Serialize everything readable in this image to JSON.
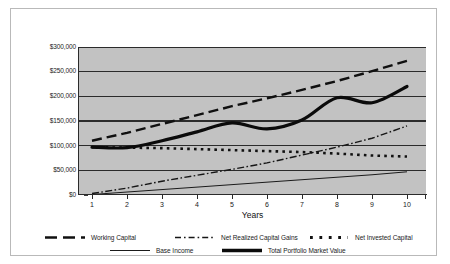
{
  "chart_data": {
    "type": "line",
    "title": "",
    "xlabel": "Years",
    "ylabel": "",
    "grid": true,
    "legend_position": "bottom",
    "x": [
      1,
      2,
      3,
      4,
      5,
      6,
      7,
      8,
      9,
      10
    ],
    "x_tick_labels": [
      "1",
      "2",
      "3",
      "4",
      "5",
      "6",
      "7",
      "8",
      "9",
      "10"
    ],
    "y_tick_labels": [
      "$0",
      "$50,000",
      "$100,000",
      "$150,000",
      "$200,000",
      "$250,000",
      "$300,000"
    ],
    "y_tick_values": [
      0,
      50000,
      100000,
      150000,
      200000,
      250000,
      300000
    ],
    "ylim": [
      0,
      300000
    ],
    "xlim": [
      0.6,
      10.6
    ],
    "series": [
      {
        "name": "Working Capital",
        "style": "dashed",
        "values": [
          110000,
          126000,
          144000,
          162000,
          180000,
          196000,
          213000,
          231000,
          251000,
          272000
        ]
      },
      {
        "name": "Net Realized Capital Gains",
        "style": "dash-dot",
        "values": [
          3000,
          14000,
          28000,
          40000,
          52000,
          65000,
          81000,
          97000,
          115000,
          140000
        ]
      },
      {
        "name": "Net Invested Capital",
        "style": "dotted",
        "values": [
          97000,
          96000,
          95000,
          93000,
          91000,
          89000,
          87000,
          84000,
          80000,
          78000
        ]
      },
      {
        "name": "Base Income",
        "style": "thin-solid",
        "values": [
          1000,
          6000,
          11000,
          16000,
          21000,
          26000,
          31000,
          36000,
          41000,
          47000
        ]
      },
      {
        "name": "Total Portfolio Market Value",
        "style": "thick-solid",
        "values": [
          97000,
          96000,
          110000,
          128000,
          146000,
          134000,
          152000,
          197000,
          187000,
          220000
        ]
      }
    ]
  },
  "axis": {
    "y_labels": [
      "$300,000",
      "$250,000",
      "$200,000",
      "$150,000",
      "$100,000",
      "$50,000",
      "$0"
    ],
    "x_labels": [
      "1",
      "2",
      "3",
      "4",
      "5",
      "6",
      "7",
      "8",
      "9",
      "10"
    ],
    "x_title": "Years"
  },
  "legend": {
    "row1": [
      {
        "label": "Working Capital",
        "icon": "dashed-line-swatch"
      },
      {
        "label": "Net Realized Capital Gains",
        "icon": "dash-dot-line-swatch"
      },
      {
        "label": "Net Invested Capital",
        "icon": "dotted-line-swatch"
      }
    ],
    "row2": [
      {
        "label": "Base Income",
        "icon": "thin-solid-line-swatch"
      },
      {
        "label": "Total Portfolio Market Value",
        "icon": "thick-solid-line-swatch"
      }
    ]
  },
  "colors": {
    "plot_background": "#c2c2c2",
    "series_line": "#111111",
    "gridline": "#2b2b2b",
    "frame_border": "#b9b9b9",
    "page_background": "#ffffff",
    "text": "#1a1a1a"
  }
}
